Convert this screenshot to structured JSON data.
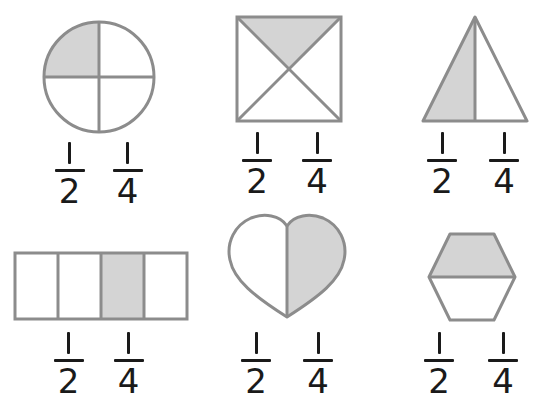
{
  "worksheet": {
    "title": "Fraction shapes worksheet",
    "description": "Six shapes each partially shaded, with two fraction choices below each.",
    "colors": {
      "stroke": "#8c8c8c",
      "shaded_fill": "#d4d4d4",
      "unshaded_fill": "#ffffff",
      "text": "#1a1a1a",
      "background": "#ffffff"
    },
    "choice_labels": {
      "numerator": "1",
      "half_denominator": "2",
      "quarter_denominator": "4",
      "half_text": "1/2",
      "quarter_text": "1/4"
    },
    "items": [
      {
        "id": "circle",
        "shape_name": "circle",
        "parts_total": 4,
        "parts_shaded": 1,
        "shaded_region": "top-left quadrant",
        "division": "vertical and horizontal diameters",
        "fraction_shaded": "1/4",
        "choices": [
          "1/2",
          "1/4"
        ]
      },
      {
        "id": "square",
        "shape_name": "square",
        "parts_total": 4,
        "parts_shaded": 1,
        "shaded_region": "top triangle",
        "division": "both diagonals",
        "fraction_shaded": "1/4",
        "choices": [
          "1/2",
          "1/4"
        ]
      },
      {
        "id": "triangle",
        "shape_name": "triangle",
        "parts_total": 2,
        "parts_shaded": 1,
        "shaded_region": "left half",
        "division": "vertical median from apex",
        "fraction_shaded": "1/2",
        "choices": [
          "1/2",
          "1/4"
        ]
      },
      {
        "id": "rectangle",
        "shape_name": "rectangle",
        "parts_total": 4,
        "parts_shaded": 1,
        "shaded_region": "third strip from left",
        "division": "three vertical lines",
        "fraction_shaded": "1/4",
        "choices": [
          "1/2",
          "1/4"
        ]
      },
      {
        "id": "heart",
        "shape_name": "heart",
        "parts_total": 2,
        "parts_shaded": 1,
        "shaded_region": "right half",
        "division": "vertical center line",
        "fraction_shaded": "1/2",
        "choices": [
          "1/2",
          "1/4"
        ]
      },
      {
        "id": "hexagon",
        "shape_name": "hexagon",
        "parts_total": 2,
        "parts_shaded": 1,
        "shaded_region": "top half",
        "division": "horizontal center line",
        "fraction_shaded": "1/2",
        "choices": [
          "1/2",
          "1/4"
        ]
      }
    ]
  }
}
